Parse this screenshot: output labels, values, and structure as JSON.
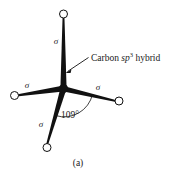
{
  "figure": {
    "caption": "(a)",
    "background_color": "#ffffff",
    "ink_color": "#111111",
    "annotation": {
      "prefix": "Carbon ",
      "orbital_italic": "sp",
      "orbital_superscript": "3",
      "suffix": " hybrid",
      "full_text": "Carbon sp3 hybrid",
      "pointer": "leader-arrow"
    },
    "angle": {
      "value": "109",
      "degree_symbol": "°",
      "label": "109°"
    },
    "center_atom": {
      "name": "carbon-nucleus",
      "x": 63.5,
      "y": 88.5,
      "radius": 4.2
    },
    "bonds": [
      {
        "id": "bond-top",
        "label": "σ",
        "label_x": 56,
        "label_y": 44,
        "lobe_x": 63.5,
        "lobe_y": 14,
        "lobe_r": 4.0
      },
      {
        "id": "bond-left",
        "label": "σ",
        "label_x": 27,
        "label_y": 88,
        "lobe_x": 14.5,
        "lobe_y": 95.5,
        "lobe_r": 4.0
      },
      {
        "id": "bond-right",
        "label": "σ",
        "label_x": 98,
        "label_y": 90,
        "lobe_x": 119,
        "lobe_y": 101,
        "lobe_r": 4.0
      },
      {
        "id": "bond-bottom-left",
        "label": "σ",
        "label_x": 41,
        "label_y": 127,
        "lobe_x": 47,
        "lobe_y": 147.5,
        "lobe_r": 4.0
      }
    ]
  }
}
